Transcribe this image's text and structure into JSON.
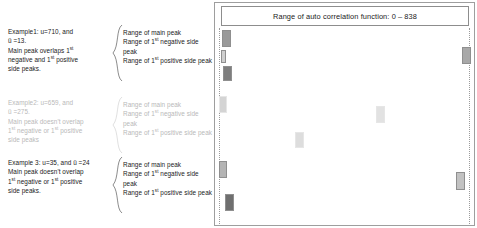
{
  "examples": [
    {
      "id": "example-1",
      "dimmed": false,
      "lines": [
        "Example1: u=710, and",
        "ü =13.",
        "Main peak overlaps 1st",
        "negative and 1st positive",
        "side peaks."
      ],
      "text": "Example1: u=710, and ü =13. Main peak overlaps 1st negative and 1st positive side peaks.",
      "ranges": [
        "Range of main peak",
        "Range of 1st negative side peak",
        "Range of 1st positive side peak"
      ]
    },
    {
      "id": "example-2",
      "dimmed": true,
      "lines": [
        "Example2: u=659, and",
        "ü =275.",
        "Main peak doesn't overlap",
        "1st negative or 1st positive",
        "side peaks"
      ],
      "text": "Example2: u=659, and ü =275. Main peak doesn't overlap 1st negative or 1st positive side peaks",
      "ranges": [
        "Range of main peak",
        "Range of 1st negative side peak",
        "Range of 1st positive side peak"
      ]
    },
    {
      "id": "example-3",
      "dimmed": false,
      "lines": [
        "Example 3: u=35, and ü =24",
        "Main peak doesn't overlap",
        "1st negative or 1st positive",
        "side peaks."
      ],
      "text": "Example 3: u=35, and ü =24 Main peak doesn't overlap 1st negative or 1st positive side peaks.",
      "ranges": [
        "Range of main peak",
        "Range of 1st negative side peak",
        "Range of 1st positive side peak"
      ]
    }
  ],
  "panel": {
    "header": "Range of auto correlation function: 0 – 838",
    "axis_min": 0,
    "axis_max": 838
  },
  "chart_data": {
    "type": "bar",
    "title": "Range of auto correlation function: 0 – 838",
    "xlabel": "",
    "ylabel": "",
    "xlim": [
      0,
      838
    ],
    "grid": false,
    "legend": "none",
    "colors": {
      "main_peak": "#9a9a9a",
      "negative_side_peak": "#c8c8c8",
      "positive_side_peak": "#7a7a7a",
      "dimmed": "#dcdcdc",
      "frame": "#9e9e9e",
      "guide_line": "#9b9b9b"
    },
    "rows": [
      {
        "name": "example-1",
        "dimmed": false,
        "bars": [
          {
            "label": "Range of main peak",
            "x": 222,
            "y": 30,
            "w": 9,
            "h": 17,
            "fill": "#9a9a9a"
          },
          {
            "label": "Range of 1st negative side peak",
            "x": 221,
            "y": 50,
            "w": 5,
            "h": 13,
            "fill": "#cfcfcf"
          },
          {
            "label": "Range of 1st positive side peak",
            "x": 223,
            "y": 66,
            "w": 9,
            "h": 15,
            "fill": "#7e7e7e"
          },
          {
            "label": "wrap of 1st negative side peak",
            "x": 462,
            "y": 47,
            "w": 9,
            "h": 17,
            "fill": "#a8a8a8"
          }
        ]
      },
      {
        "name": "example-2",
        "dimmed": true,
        "bars": [
          {
            "label": "Range of main peak",
            "x": 219,
            "y": 96,
            "w": 8,
            "h": 17,
            "fill": "#d4d4d4"
          },
          {
            "label": "Range of 1st negative side peak",
            "x": 295,
            "y": 132,
            "w": 9,
            "h": 16,
            "fill": "#dddddd"
          },
          {
            "label": "Range of 1st positive side peak",
            "x": 376,
            "y": 106,
            "w": 9,
            "h": 17,
            "fill": "#e2e2e2"
          }
        ]
      },
      {
        "name": "example-3",
        "dimmed": false,
        "bars": [
          {
            "label": "Range of main peak",
            "x": 219,
            "y": 161,
            "w": 8,
            "h": 17,
            "fill": "#b4b4b4"
          },
          {
            "label": "Range of 1st positive side peak",
            "x": 225,
            "y": 194,
            "w": 9,
            "h": 17,
            "fill": "#6f6f6f"
          },
          {
            "label": "Range of 1st negative side peak",
            "x": 456,
            "y": 172,
            "w": 9,
            "h": 18,
            "fill": "#c2c2c2"
          }
        ]
      }
    ]
  }
}
